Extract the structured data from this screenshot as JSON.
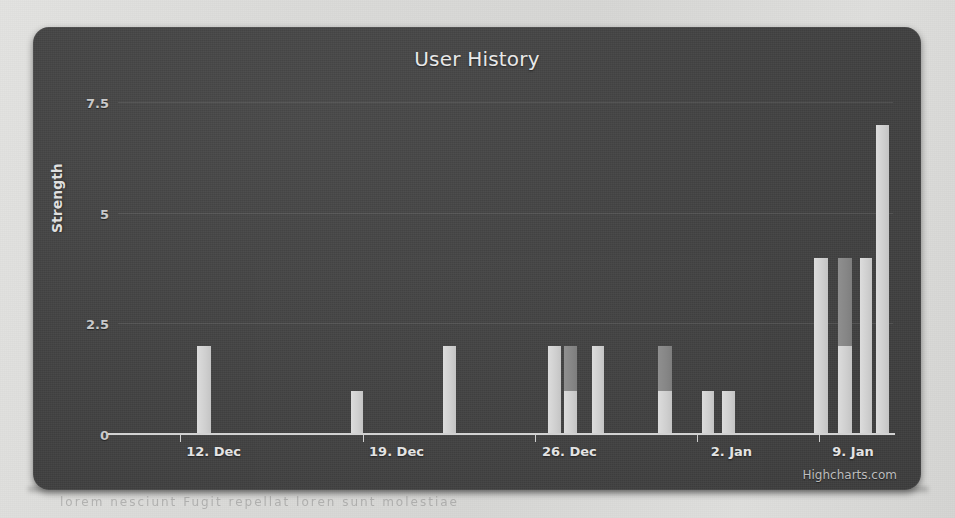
{
  "page": {
    "background_color": "#d9d9d7",
    "scan_artifact_text": "lorem  nesciunt  Fugit repellat  loren  sunt  molestiae"
  },
  "chart_panel": {
    "background_color": "#434343",
    "credit_label": "Highcharts.com"
  },
  "chart_data": {
    "type": "bar",
    "title": "User History",
    "subtitle": "",
    "xlabel": "",
    "ylabel": "Strength",
    "ylim": [
      0,
      8.4
    ],
    "yticks": [
      0,
      2.5,
      5,
      7.5
    ],
    "ytick_labels": [
      "0",
      "2.5",
      "5",
      "7.5"
    ],
    "grid": true,
    "legend_position": "none",
    "xtick_labels": [
      "12. Dec",
      "19. Dec",
      "26. Dec",
      "2. Jan",
      "9. Jan"
    ],
    "xtick_positions": [
      0.0795,
      0.3155,
      0.5385,
      0.7475,
      0.9045
    ],
    "colors": {
      "primary": "#cfcfcf",
      "secondary": "#868686"
    },
    "series": [
      {
        "name": "Series 1",
        "color": "#cfcfcf"
      },
      {
        "name": "Series 2",
        "color": "#868686"
      }
    ],
    "bars": [
      {
        "x_fraction": 0.102,
        "width_fraction": 0.0175,
        "segments": [
          {
            "series": 0,
            "value": 2
          }
        ]
      },
      {
        "x_fraction": 0.3,
        "width_fraction": 0.0165,
        "segments": [
          {
            "series": 0,
            "value": 1
          }
        ]
      },
      {
        "x_fraction": 0.419,
        "width_fraction": 0.0175,
        "segments": [
          {
            "series": 0,
            "value": 2
          }
        ]
      },
      {
        "x_fraction": 0.555,
        "width_fraction": 0.0165,
        "segments": [
          {
            "series": 0,
            "value": 2
          }
        ]
      },
      {
        "x_fraction": 0.576,
        "width_fraction": 0.0165,
        "segments": [
          {
            "series": 0,
            "value": 1
          },
          {
            "series": 1,
            "value": 1
          }
        ]
      },
      {
        "x_fraction": 0.611,
        "width_fraction": 0.0165,
        "segments": [
          {
            "series": 0,
            "value": 2
          }
        ]
      },
      {
        "x_fraction": 0.697,
        "width_fraction": 0.0175,
        "segments": [
          {
            "series": 0,
            "value": 1
          },
          {
            "series": 1,
            "value": 1
          }
        ]
      },
      {
        "x_fraction": 0.753,
        "width_fraction": 0.0165,
        "segments": [
          {
            "series": 0,
            "value": 1
          }
        ]
      },
      {
        "x_fraction": 0.779,
        "width_fraction": 0.0165,
        "segments": [
          {
            "series": 0,
            "value": 1
          }
        ]
      },
      {
        "x_fraction": 0.898,
        "width_fraction": 0.0185,
        "segments": [
          {
            "series": 0,
            "value": 4
          }
        ]
      },
      {
        "x_fraction": 0.929,
        "width_fraction": 0.0185,
        "segments": [
          {
            "series": 0,
            "value": 2
          },
          {
            "series": 1,
            "value": 2
          }
        ]
      },
      {
        "x_fraction": 0.957,
        "width_fraction": 0.0155,
        "segments": [
          {
            "series": 0,
            "value": 4
          }
        ]
      },
      {
        "x_fraction": 0.978,
        "width_fraction": 0.0165,
        "segments": [
          {
            "series": 0,
            "value": 7
          }
        ]
      }
    ]
  }
}
